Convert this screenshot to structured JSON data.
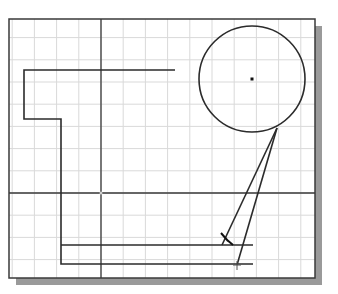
{
  "canvas": {
    "width": 338,
    "height": 294,
    "background": "#ffffff",
    "viewport": {
      "x": 9,
      "y": 19,
      "w": 306,
      "h": 259
    },
    "shadow": {
      "color": "#9a9a9a",
      "offset": 7
    },
    "border_color": "#3a3a3a",
    "grid": {
      "spacing": 22.2,
      "color": "#d9d9d9"
    },
    "axes": {
      "x_axis_y": 193,
      "y_axis_x": 101,
      "color": "#3a3a3a"
    },
    "origin_marker": "cross"
  },
  "geometry": {
    "line_color": "#2b2b2b",
    "polyline_outline": [
      [
        175,
        70
      ],
      [
        24,
        70
      ],
      [
        24,
        119
      ],
      [
        61,
        119
      ],
      [
        61,
        264
      ],
      [
        253,
        264
      ]
    ],
    "line_inner": [
      [
        61,
        245
      ],
      [
        253,
        245
      ]
    ],
    "circle": {
      "cx": 252,
      "cy": 79,
      "r": 53,
      "center_mark": true
    },
    "tangent_lines": [
      [
        [
          277,
          128
        ],
        [
          222,
          245
        ]
      ],
      [
        [
          277,
          128
        ],
        [
          237,
          265
        ]
      ]
    ],
    "snap_marker": {
      "x": 225,
      "y": 238,
      "type": "angle-tick"
    },
    "endpoint_marker": {
      "x": 237,
      "y": 265,
      "type": "cross"
    }
  }
}
